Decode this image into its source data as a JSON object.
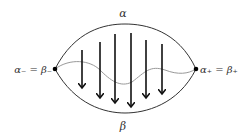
{
  "diagram": {
    "top_label": "α",
    "bottom_label": "β",
    "left_label": "α₋ = β₋",
    "right_label": "α₊ = β₊",
    "colors": {
      "curve": "#333333",
      "wavy": "#999999",
      "arrow": "#111111"
    },
    "nodes": [
      {
        "name": "left-node",
        "x": 55,
        "y": 69
      },
      {
        "name": "right-node",
        "x": 196,
        "y": 69
      }
    ],
    "arrows": [
      {
        "x": 82,
        "y1": 50,
        "y2": 88
      },
      {
        "x": 100,
        "y1": 42,
        "y2": 98
      },
      {
        "x": 115,
        "y1": 34,
        "y2": 103
      },
      {
        "x": 131,
        "y1": 33,
        "y2": 107
      },
      {
        "x": 146,
        "y1": 40,
        "y2": 98
      },
      {
        "x": 162,
        "y1": 44,
        "y2": 94
      }
    ]
  }
}
